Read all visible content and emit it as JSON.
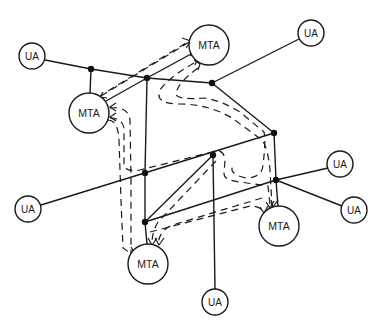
{
  "diagram": {
    "type": "network-topology",
    "colors": {
      "line": "#1a1a1a",
      "background": "#ffffff"
    },
    "nodes": [
      {
        "id": "ua_top_left",
        "label": "UA",
        "kind": "UA",
        "x": 32,
        "y": 56,
        "r": 13
      },
      {
        "id": "mta_top",
        "label": "MTA",
        "kind": "MTA",
        "x": 209,
        "y": 45,
        "r": 20
      },
      {
        "id": "ua_top_right",
        "label": "UA",
        "kind": "UA",
        "x": 311,
        "y": 33,
        "r": 13
      },
      {
        "id": "mta_left",
        "label": "MTA",
        "kind": "MTA",
        "x": 89,
        "y": 113,
        "r": 20
      },
      {
        "id": "ua_right_upper",
        "label": "UA",
        "kind": "UA",
        "x": 340,
        "y": 164,
        "r": 13
      },
      {
        "id": "ua_right_lower",
        "label": "UA",
        "kind": "UA",
        "x": 354,
        "y": 210,
        "r": 13
      },
      {
        "id": "ua_left",
        "label": "UA",
        "kind": "UA",
        "x": 28,
        "y": 209,
        "r": 13
      },
      {
        "id": "mta_right",
        "label": "MTA",
        "kind": "MTA",
        "x": 279,
        "y": 226,
        "r": 20
      },
      {
        "id": "mta_bottom",
        "label": "MTA",
        "kind": "MTA",
        "x": 148,
        "y": 264,
        "r": 20
      },
      {
        "id": "ua_bottom",
        "label": "UA",
        "kind": "UA",
        "x": 215,
        "y": 302,
        "r": 13
      }
    ],
    "junctions": [
      {
        "id": "A",
        "x": 91,
        "y": 69
      },
      {
        "id": "B",
        "x": 147,
        "y": 78
      },
      {
        "id": "C",
        "x": 212,
        "y": 83
      },
      {
        "id": "D",
        "x": 274,
        "y": 133
      },
      {
        "id": "E",
        "x": 145,
        "y": 173
      },
      {
        "id": "F",
        "x": 213,
        "y": 155
      },
      {
        "id": "G",
        "x": 276,
        "y": 180
      },
      {
        "id": "H",
        "x": 145,
        "y": 222
      }
    ],
    "legend": {
      "solid_line": "physical link",
      "dashed_arrow": "message route"
    }
  }
}
